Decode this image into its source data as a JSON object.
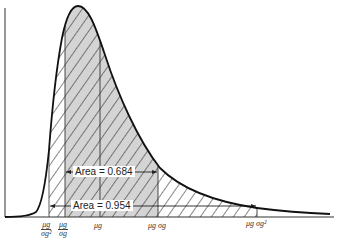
{
  "diagram": {
    "type": "lognormal distribution curve",
    "colors": {
      "line": "#111111",
      "shade": "#d0d0d0",
      "hatch": "#222222",
      "background": "#ffffff"
    },
    "x_markers": [
      {
        "id": "mu_over_sigma2",
        "num": "μg",
        "den": "σg²",
        "x": 49
      },
      {
        "id": "mu_over_sigma",
        "num": "μg",
        "den": "σg",
        "x": 65
      },
      {
        "id": "mu",
        "label": "μg",
        "x": 100
      },
      {
        "id": "mu_times_sigma",
        "label": "μg σg",
        "x": 158
      },
      {
        "id": "mu_times_sigma2",
        "label": "μg σg²",
        "x": 257
      }
    ],
    "labels": {
      "tick_mu_num_1": "μ",
      "tick_g": "g",
      "area_684": "Area = 0.684",
      "area_954": "Area = 0.954"
    },
    "annotations": [
      {
        "text": "Area = 0.684",
        "from": "μg/σg",
        "to": "μg σg"
      },
      {
        "text": "Area = 0.954",
        "from": "μg/σg²",
        "to": "μg σg²"
      }
    ]
  }
}
